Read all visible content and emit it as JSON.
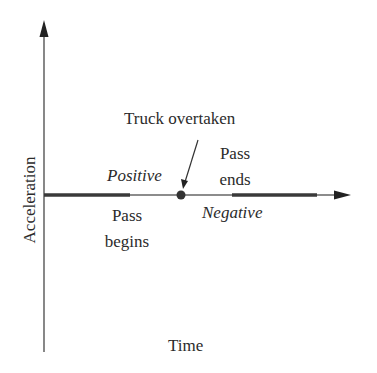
{
  "diagram": {
    "axes": {
      "y_label": "Acceleration",
      "x_label": "Time"
    },
    "annotations": {
      "event": "Truck overtaken",
      "positive": "Positive",
      "negative": "Negative",
      "pass_begins_line1": "Pass",
      "pass_begins_line2": "begins",
      "pass_ends_line1": "Pass",
      "pass_ends_line2": "ends"
    },
    "colors": {
      "axis": "#444444",
      "thick_segment": "#3a3a3a",
      "dot": "#333333",
      "text": "#2b2b2b"
    }
  }
}
